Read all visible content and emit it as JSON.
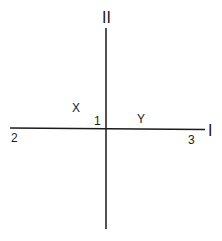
{
  "diagram": {
    "axes": {
      "vertical_label": "II",
      "horizontal_label": "I"
    },
    "points": {
      "center": "1",
      "left_end": "2",
      "right_end": "3"
    },
    "regions": {
      "upper_left": "X",
      "upper_right": "Y"
    },
    "line_color": "#1a1a1a"
  }
}
